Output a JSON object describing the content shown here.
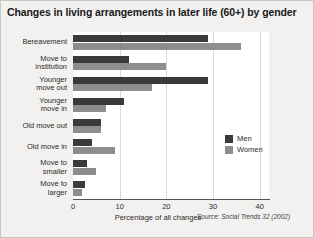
{
  "chart_data": {
    "type": "bar",
    "orientation": "horizontal",
    "title": "Changes in living arrangements in later life (60+) by gender",
    "xlabel": "Percentage of all changes",
    "ylabel": "",
    "xlim": [
      0,
      42
    ],
    "xticks": [
      0,
      10,
      20,
      30,
      40
    ],
    "xtick_labels": [
      "0",
      "10",
      "20",
      "30",
      "40"
    ],
    "grid": true,
    "grid_axis": "x",
    "legend_position": "right-middle",
    "source": "Source: Social Trends 32 (2002)",
    "categories": [
      "Bereavement",
      "Move to institution",
      "Younger move out",
      "Younger move in",
      "Old move out",
      "Old move in",
      "Move to smaller",
      "Move to larger"
    ],
    "category_lines": [
      [
        "Bereavement"
      ],
      [
        "Move to",
        "institution"
      ],
      [
        "Younger",
        "move out"
      ],
      [
        "Younger",
        "move in"
      ],
      [
        "Old move out"
      ],
      [
        "Old move in"
      ],
      [
        "Move to",
        "smaller"
      ],
      [
        "Move to",
        "larger"
      ]
    ],
    "series": [
      {
        "name": "Men",
        "color": "#3a3a3a",
        "values": [
          29,
          12,
          29,
          11,
          6,
          4,
          3,
          2.5
        ]
      },
      {
        "name": "Women",
        "color": "#8d8d8d",
        "values": [
          36,
          20,
          17,
          7,
          6,
          9,
          5,
          2
        ]
      }
    ]
  },
  "legend": {
    "items": [
      {
        "label": "Men",
        "color": "#3a3a3a"
      },
      {
        "label": "Women",
        "color": "#8d8d8d"
      }
    ]
  }
}
